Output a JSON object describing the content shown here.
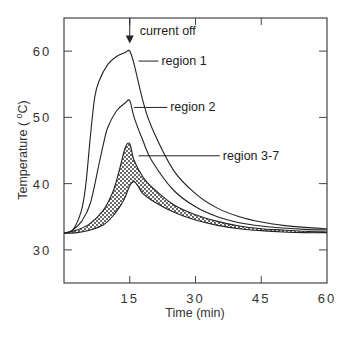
{
  "chart_data": {
    "type": "line",
    "title": "",
    "xlabel": "Time  (min)",
    "ylabel": "Temperature  ( °C)",
    "ylabel_parts": {
      "text": "Temperature  ( ",
      "sup": "o",
      "unit": "C)"
    },
    "xlim": [
      0,
      60
    ],
    "ylim": [
      25,
      65
    ],
    "xticks": [
      15,
      30,
      45,
      60
    ],
    "yticks": [
      30,
      40,
      50,
      60
    ],
    "xtick_labels": [
      "15",
      "30",
      "45",
      "60"
    ],
    "ytick_labels": [
      "30",
      "40",
      "50",
      "60"
    ],
    "grid": false,
    "legend": "none",
    "series": [
      {
        "name": "region 1",
        "x": [
          0,
          2,
          4,
          5,
          6,
          7,
          8,
          10,
          12,
          14,
          15,
          16,
          18,
          20,
          25,
          30,
          35,
          40,
          45,
          50,
          55,
          60
        ],
        "values": [
          32.5,
          33,
          36,
          40,
          47,
          53,
          55.5,
          58,
          59.2,
          59.8,
          60,
          58,
          52.5,
          48.5,
          42,
          38.5,
          36.3,
          35,
          34.2,
          33.7,
          33.4,
          33.2
        ]
      },
      {
        "name": "region 2",
        "x": [
          0,
          2,
          4,
          6,
          8,
          9,
          10,
          12,
          14,
          15,
          16,
          18,
          20,
          25,
          30,
          35,
          40,
          45,
          50,
          55,
          60
        ],
        "values": [
          32.5,
          33,
          34.3,
          37,
          43,
          46,
          48.5,
          51,
          52.2,
          52.5,
          50,
          46.5,
          43.5,
          39,
          36.5,
          35,
          34.1,
          33.6,
          33.3,
          33.1,
          33
        ]
      },
      {
        "name": "region 3-7 (upper bound)",
        "x": [
          0,
          3,
          6,
          9,
          11,
          12,
          13,
          14,
          15,
          16,
          18,
          20,
          25,
          30,
          35,
          40,
          45,
          50,
          55,
          60
        ],
        "values": [
          32.5,
          33,
          34,
          36,
          38.5,
          40.5,
          43,
          45.5,
          46,
          43.5,
          41,
          39.5,
          36.8,
          35.3,
          34.3,
          33.6,
          33.2,
          33,
          32.8,
          32.7
        ]
      },
      {
        "name": "region 3-7 (lower bound)",
        "x": [
          0,
          3,
          6,
          9,
          11,
          13,
          14,
          15,
          16,
          17,
          18,
          20,
          25,
          30,
          35,
          40,
          45,
          50,
          55,
          60
        ],
        "values": [
          32.5,
          32.6,
          33,
          33.8,
          35,
          36.8,
          38,
          39.7,
          40.3,
          39.5,
          38.5,
          37.5,
          35.7,
          34.5,
          33.7,
          33.2,
          32.9,
          32.7,
          32.6,
          32.6
        ]
      }
    ],
    "annotations": [
      {
        "text": "current   off",
        "x": 15,
        "y": 63,
        "arrow": "down",
        "target_x": 15,
        "target_y": 61
      },
      {
        "text": "region  1",
        "x": 22,
        "y": 58.5,
        "leader_to": [
          17,
          58.5
        ]
      },
      {
        "text": "region  2",
        "x": 24,
        "y": 51.5,
        "leader_to": [
          16,
          51.5
        ]
      },
      {
        "text": "region   3-7",
        "x": 36,
        "y": 44.2,
        "leader_to": [
          17,
          44.2
        ]
      }
    ],
    "shaded_band": {
      "between": [
        "region 3-7 (upper bound)",
        "region 3-7 (lower bound)"
      ],
      "pattern": "stipple"
    }
  }
}
